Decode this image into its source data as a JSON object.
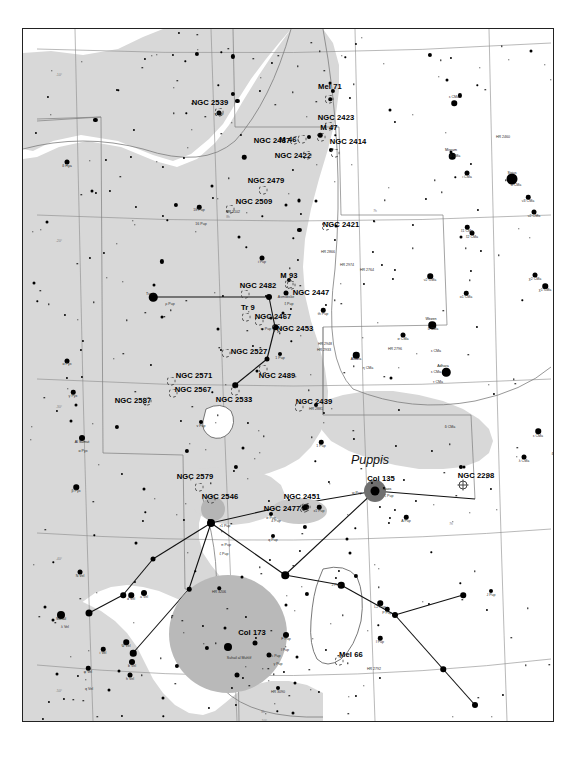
{
  "chart": {
    "constellations": [
      {
        "name": "Puppis",
        "x": 347,
        "y": 431
      }
    ],
    "deep_sky_objects": [
      {
        "label": "NGC 2539",
        "lx": 187,
        "ly": 73,
        "mx": 196,
        "my": 83,
        "marker": "open"
      },
      {
        "label": "Mel 71",
        "lx": 307,
        "ly": 57,
        "mx": 306,
        "my": 70,
        "marker": "open"
      },
      {
        "label": "NGC 2423",
        "lx": 313,
        "ly": 88,
        "mx": 306,
        "my": 97,
        "marker": "open"
      },
      {
        "label": "M 47",
        "lx": 306,
        "ly": 98,
        "mx": 298,
        "my": 108,
        "marker": "open"
      },
      {
        "label": "M 46",
        "lx": 265,
        "ly": 110,
        "mx": 279,
        "my": 110,
        "marker": "open"
      },
      {
        "label": "NGC 2437",
        "lx": 249,
        "ly": 111,
        "mx": 271,
        "my": 111,
        "marker": "open"
      },
      {
        "label": "NGC 2414",
        "lx": 325,
        "ly": 112,
        "mx": 312,
        "my": 124,
        "marker": "open"
      },
      {
        "label": "NGC 2422",
        "lx": 270,
        "ly": 126,
        "mx": 284,
        "my": 126,
        "marker": "open"
      },
      {
        "label": "NGC 2479",
        "lx": 243,
        "ly": 151,
        "mx": 240,
        "my": 161,
        "marker": "open"
      },
      {
        "label": "NGC 2509",
        "lx": 231,
        "ly": 172,
        "mx": 207,
        "my": 180,
        "marker": "open"
      },
      {
        "label": "NGC 2421",
        "lx": 318,
        "ly": 195,
        "mx": 303,
        "my": 197,
        "marker": "open"
      },
      {
        "label": "M 93",
        "lx": 266,
        "ly": 246,
        "mx": 266,
        "my": 255,
        "marker": "open"
      },
      {
        "label": "NGC 2482",
        "lx": 235,
        "ly": 256,
        "mx": 222,
        "my": 265,
        "marker": "open"
      },
      {
        "label": "NGC 2447",
        "lx": 288,
        "ly": 263,
        "mx": 268,
        "my": 256,
        "marker": "open"
      },
      {
        "label": "Tr 9",
        "lx": 225,
        "ly": 278,
        "mx": 223,
        "my": 288,
        "marker": "open"
      },
      {
        "label": "NGC 2467",
        "lx": 250,
        "ly": 287,
        "mx": 236,
        "my": 292,
        "marker": "open"
      },
      {
        "label": "NGC 2453",
        "lx": 272,
        "ly": 299,
        "mx": 254,
        "my": 299,
        "marker": "open"
      },
      {
        "label": "NGC 2527",
        "lx": 226,
        "ly": 322,
        "mx": 203,
        "my": 324,
        "marker": "open"
      },
      {
        "label": "NGC 2489",
        "lx": 254,
        "ly": 346,
        "mx": 240,
        "my": 340,
        "marker": "open"
      },
      {
        "label": "NGC 2571",
        "lx": 171,
        "ly": 346,
        "mx": 148,
        "my": 352,
        "marker": "open"
      },
      {
        "label": "NGC 2567",
        "lx": 170,
        "ly": 360,
        "mx": 150,
        "my": 364,
        "marker": "open"
      },
      {
        "label": "NGC 2533",
        "lx": 211,
        "ly": 370,
        "mx": 212,
        "my": 362,
        "marker": "open"
      },
      {
        "label": "NGC 2587",
        "lx": 110,
        "ly": 371,
        "mx": 124,
        "my": 372,
        "marker": "open"
      },
      {
        "label": "NGC 2439",
        "lx": 291,
        "ly": 372,
        "mx": 276,
        "my": 378,
        "marker": "open"
      },
      {
        "label": "NGC 2579",
        "lx": 172,
        "ly": 447,
        "mx": 176,
        "my": 458,
        "marker": "open"
      },
      {
        "label": "NGC 2546",
        "lx": 197,
        "ly": 467,
        "mx": 188,
        "my": 470,
        "marker": "open"
      },
      {
        "label": "NGC 2451",
        "lx": 279,
        "ly": 467,
        "mx": 283,
        "my": 478,
        "marker": "open"
      },
      {
        "label": "NGC 2477",
        "lx": 259,
        "ly": 479,
        "mx": 281,
        "my": 479,
        "marker": "open"
      },
      {
        "label": "Col 135",
        "lx": 358,
        "ly": 449,
        "mx": 352,
        "my": 462,
        "marker": "none"
      },
      {
        "label": "NGC 2298",
        "lx": 453,
        "ly": 446,
        "mx": 440,
        "my": 456,
        "marker": "globular"
      },
      {
        "label": "Col 173",
        "lx": 229,
        "ly": 603,
        "mx": 205,
        "my": 605,
        "marker": "none"
      },
      {
        "label": "Mel 66",
        "lx": 328,
        "ly": 625,
        "mx": 316,
        "my": 632,
        "marker": "open"
      }
    ],
    "star_names": [
      {
        "label": "δ Hya",
        "x": 44,
        "y": 137
      },
      {
        "label": "α Pyx",
        "x": 44,
        "y": 335
      },
      {
        "label": "γ Pyx",
        "x": 50,
        "y": 367
      },
      {
        "label": "Al Sumut",
        "x": 59,
        "y": 413,
        "named": true
      },
      {
        "label": "α Pyx",
        "x": 60,
        "y": 422
      },
      {
        "label": "β Pyx",
        "x": 53,
        "y": 462
      },
      {
        "label": "γ Pup",
        "x": 196,
        "y": 85
      },
      {
        "label": "18 Pup",
        "x": 176,
        "y": 181
      },
      {
        "label": "HR 3102",
        "x": 210,
        "y": 183
      },
      {
        "label": "16 Pup",
        "x": 178,
        "y": 195
      },
      {
        "label": "i Pup",
        "x": 239,
        "y": 233
      },
      {
        "label": "Tureis",
        "x": 128,
        "y": 265,
        "named": true
      },
      {
        "label": "ρ Pup",
        "x": 147,
        "y": 275
      },
      {
        "label": "Asmidiske",
        "x": 263,
        "y": 268
      },
      {
        "label": "ξ Pup",
        "x": 266,
        "y": 275
      },
      {
        "label": "k Pup",
        "x": 250,
        "y": 289
      },
      {
        "label": "m Pup",
        "x": 243,
        "y": 300
      },
      {
        "label": "th Pup",
        "x": 300,
        "y": 285
      },
      {
        "label": "HR 2948",
        "x": 302,
        "y": 315
      },
      {
        "label": "HR 2933",
        "x": 301,
        "y": 321
      },
      {
        "label": "HR 2866",
        "x": 305,
        "y": 223
      },
      {
        "label": "HR 2974",
        "x": 324,
        "y": 236
      },
      {
        "label": "HR 2764",
        "x": 344,
        "y": 241
      },
      {
        "label": "HR 2881",
        "x": 293,
        "y": 380
      },
      {
        "label": "1 Pup",
        "x": 257,
        "y": 329
      },
      {
        "label": "1 Pup",
        "x": 298,
        "y": 417
      },
      {
        "label": "v Pup",
        "x": 178,
        "y": 397
      },
      {
        "label": "Naos",
        "x": 364,
        "y": 460,
        "named": true
      },
      {
        "label": "ζ Pup",
        "x": 366,
        "y": 467
      },
      {
        "label": "w Pup",
        "x": 334,
        "y": 464
      },
      {
        "label": "x1 Pup",
        "x": 296,
        "y": 482
      },
      {
        "label": "σ Pup",
        "x": 248,
        "y": 489
      },
      {
        "label": "4 Pup",
        "x": 253,
        "y": 492
      },
      {
        "label": "r1 Pup",
        "x": 202,
        "y": 497
      },
      {
        "label": "π Pup",
        "x": 203,
        "y": 516
      },
      {
        "label": "ζ Pup",
        "x": 201,
        "y": 525
      },
      {
        "label": "q Pup",
        "x": 250,
        "y": 511
      },
      {
        "label": "A Pup",
        "x": 383,
        "y": 492
      },
      {
        "label": "J Pup",
        "x": 313,
        "y": 556
      },
      {
        "label": "J Pup",
        "x": 468,
        "y": 566
      },
      {
        "label": "L2 Pup",
        "x": 357,
        "y": 578
      },
      {
        "label": "P Pup",
        "x": 364,
        "y": 584
      },
      {
        "label": "l Pup",
        "x": 357,
        "y": 613
      },
      {
        "label": "HR 2792",
        "x": 351,
        "y": 640
      },
      {
        "label": "F Pup",
        "x": 263,
        "y": 610
      },
      {
        "label": "l Pup",
        "x": 262,
        "y": 621
      },
      {
        "label": "c Pup",
        "x": 253,
        "y": 627
      },
      {
        "label": "Suhail al Muhlif",
        "x": 216,
        "y": 629
      },
      {
        "label": "γ Pup",
        "x": 255,
        "y": 635
      },
      {
        "label": "HR 3206",
        "x": 196,
        "y": 563
      },
      {
        "label": "HR 3090",
        "x": 255,
        "y": 663
      },
      {
        "label": "HR 2834",
        "x": 305,
        "y": 707
      },
      {
        "label": "N Vel",
        "x": 57,
        "y": 547
      },
      {
        "label": "Suhail",
        "x": 38,
        "y": 590,
        "named": true
      },
      {
        "label": "λ Vel",
        "x": 42,
        "y": 598
      },
      {
        "label": "d Vel",
        "x": 108,
        "y": 570
      },
      {
        "label": "a Vel",
        "x": 121,
        "y": 568
      },
      {
        "label": "Ψ Vel",
        "x": 103,
        "y": 617
      },
      {
        "label": "b Vel",
        "x": 109,
        "y": 637
      },
      {
        "label": "h Vel",
        "x": 107,
        "y": 650
      },
      {
        "label": "φ Vel",
        "x": 65,
        "y": 643
      },
      {
        "label": "i Vel",
        "x": 80,
        "y": 624
      },
      {
        "label": "q Vel",
        "x": 66,
        "y": 660
      },
      {
        "label": "ε CMa",
        "x": 431,
        "y": 68
      },
      {
        "label": "Mirzam",
        "x": 428,
        "y": 121,
        "named": true
      },
      {
        "label": "β CMa",
        "x": 432,
        "y": 127
      },
      {
        "label": "HR 2460",
        "x": 480,
        "y": 108
      },
      {
        "label": "ι CMa",
        "x": 444,
        "y": 148
      },
      {
        "label": "Sirius",
        "x": 489,
        "y": 144,
        "named": true
      },
      {
        "label": "α CMa",
        "x": 493,
        "y": 156
      },
      {
        "label": "ν3 CMa",
        "x": 505,
        "y": 172
      },
      {
        "label": "ν2 CMa",
        "x": 511,
        "y": 187
      },
      {
        "label": "ξ1 CMa",
        "x": 444,
        "y": 202
      },
      {
        "label": "ξ2 CMa",
        "x": 449,
        "y": 208
      },
      {
        "label": "ν2 CMa",
        "x": 407,
        "y": 251
      },
      {
        "label": "ο1 CMa",
        "x": 443,
        "y": 268
      },
      {
        "label": "χ2 CMa",
        "x": 512,
        "y": 250
      },
      {
        "label": "χ1 CMa",
        "x": 522,
        "y": 261
      },
      {
        "label": "Wezen",
        "x": 408,
        "y": 290,
        "named": true
      },
      {
        "label": "δ CMa",
        "x": 410,
        "y": 300
      },
      {
        "label": "σ CMa",
        "x": 380,
        "y": 310
      },
      {
        "label": "HR 2796",
        "x": 372,
        "y": 320
      },
      {
        "label": "Aludra",
        "x": 333,
        "y": 330,
        "named": true
      },
      {
        "label": "η CMa",
        "x": 345,
        "y": 339
      },
      {
        "label": "ε CMa",
        "x": 413,
        "y": 322
      },
      {
        "label": "ε CMa",
        "x": 413,
        "y": 343
      },
      {
        "label": "Adhara",
        "x": 420,
        "y": 337,
        "named": true
      },
      {
        "label": "τ CMa",
        "x": 415,
        "y": 353
      },
      {
        "label": "δ CMa",
        "x": 427,
        "y": 398
      },
      {
        "label": "ε CMa",
        "x": 515,
        "y": 407
      },
      {
        "label": "δ Col",
        "x": 533,
        "y": 425
      },
      {
        "label": "η Col",
        "x": 545,
        "y": 453
      },
      {
        "label": "λ CMa",
        "x": 501,
        "y": 432
      }
    ],
    "ticks": [
      {
        "label": "-10°",
        "x": 36,
        "y": 46
      },
      {
        "label": "-20°",
        "x": 36,
        "y": 212
      },
      {
        "label": "-30°",
        "x": 36,
        "y": 378
      },
      {
        "label": "-40°",
        "x": 36,
        "y": 530
      },
      {
        "label": "-50°",
        "x": 36,
        "y": 662
      },
      {
        "label": "8h",
        "x": 205,
        "y": 188
      },
      {
        "label": "7h",
        "x": 352,
        "y": 182
      },
      {
        "label": "-20°",
        "x": 549,
        "y": 213
      },
      {
        "label": "-30°",
        "x": 549,
        "y": 376
      },
      {
        "label": "7h",
        "x": 428,
        "y": 495
      },
      {
        "label": "8h",
        "x": 240,
        "y": 683
      },
      {
        "label": "-50°",
        "x": 241,
        "y": 692
      }
    ],
    "legend": {
      "open_cluster": "open-cluster-marker",
      "globular_cluster": "globular-cluster-marker",
      "star": "star-marker"
    },
    "colors": {
      "background": "#ffffff",
      "milky_way": "#d8d8d8",
      "star": "#000000",
      "grid": "#8a8a8a",
      "halo": "#b9b9b9"
    }
  }
}
